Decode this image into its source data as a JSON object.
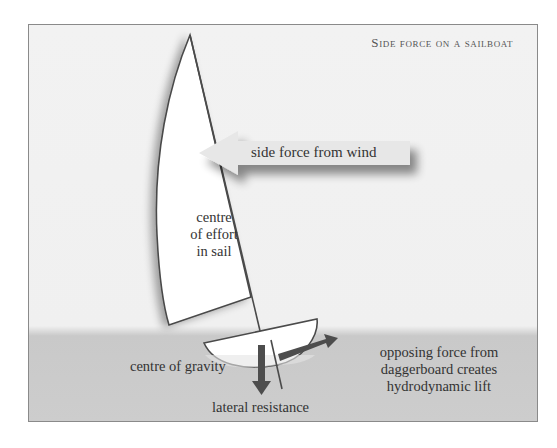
{
  "diagram": {
    "title": "Side force on a sailboat",
    "labels": {
      "side_force": "side force from wind",
      "centre_effort_1": "centre",
      "centre_effort_2": "of effort",
      "centre_effort_3": "in sail",
      "centre_gravity": "centre of gravity",
      "lateral_resistance": "lateral resistance",
      "opposing_1": "opposing force from",
      "opposing_2": "daggerboard creates",
      "opposing_3": "hydrodynamic lift"
    },
    "colors": {
      "background": "#f1f1f1",
      "water": "#cbcbcb",
      "sail_fill": "#ffffff",
      "outline": "#4a4a4a",
      "force_arrow": "#4d4d4d",
      "wind_arrow": "#e6e6e6"
    }
  }
}
